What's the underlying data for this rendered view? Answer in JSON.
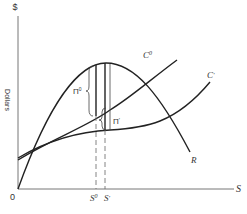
{
  "diagram": {
    "y_axis_label": "$",
    "y_axis_title": "Dollars",
    "x_axis_label": "S",
    "origin_label": "0",
    "curves": {
      "revenue": "R",
      "cost_0": "C",
      "cost_0_sup": "0",
      "cost_1": "C",
      "cost_1_sup": "′"
    },
    "profit_0": "Π",
    "profit_0_sup": "0",
    "profit_1": "Π",
    "profit_1_sup": "′",
    "s0": "S",
    "s0_sup": "0",
    "s1": "S",
    "s1_sup": "′",
    "colors": {
      "line": "#222222",
      "axis": "#555555",
      "dashed": "#666666"
    }
  }
}
